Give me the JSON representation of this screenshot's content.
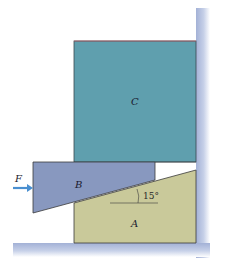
{
  "figure": {
    "type": "wedge-and-block statics diagram",
    "labels": {
      "block_c": "C",
      "wedge_b": "B",
      "wedge_a": "A",
      "force": "F",
      "angle": "15°"
    },
    "colors": {
      "block_c": "#5f9fae",
      "wedge_b": "#8898bf",
      "wedge_a": "#c9c99a",
      "wall": "#a9b6d8",
      "floor": "#a9b6d8",
      "arrow": "#4a8fd0",
      "outline": "#3a3a3a",
      "c_top_edge": "#b5606a"
    },
    "angle_degrees": 15
  }
}
